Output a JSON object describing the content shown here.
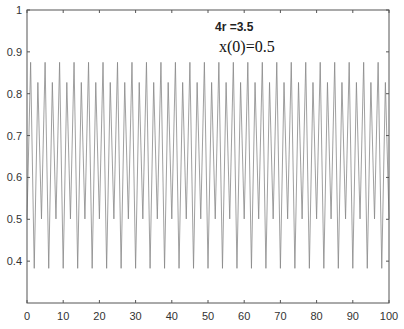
{
  "chart_data": {
    "type": "line",
    "title": "",
    "xlabel": "",
    "ylabel": "",
    "xlim": [
      0,
      100
    ],
    "ylim": [
      0.3,
      1
    ],
    "xticks": [
      0,
      10,
      20,
      30,
      40,
      50,
      60,
      70,
      80,
      90,
      100
    ],
    "yticks": [
      0.4,
      0.5,
      0.6,
      0.7,
      0.8,
      0.9,
      1
    ],
    "ytick_labels": [
      "0.4",
      "0.5",
      "0.6",
      "0.7",
      "0.8",
      "0.9",
      "1"
    ],
    "grid": false,
    "legend": null,
    "annotations": [
      "4r =3.5",
      "x(0)=0.5"
    ],
    "series": [
      {
        "name": "x(n)",
        "color": "#888888",
        "description": "Logistic map x(n+1)=4r·x(n)(1-x(n)) with r=0.875 (4r=3.5), period-4 cycle",
        "cycle_values": [
          0.875,
          0.3828,
          0.8269,
          0.5009
        ],
        "x0": 0.5,
        "n_points": 101
      }
    ]
  },
  "annotations": {
    "param": "4r =3.5",
    "init": "x(0)=0.5"
  }
}
